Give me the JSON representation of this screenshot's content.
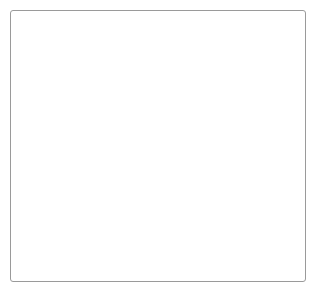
{
  "figure": {
    "title": "Lumbar spine sagittal section illustration",
    "view": "lateral sagittal",
    "style": "grayscale pen-and-ink medical illustration",
    "frame": {
      "border_color": "#9a9a9a",
      "border_width_px": 1,
      "corner_radius_px": 3,
      "background_color": "#ffffff",
      "x": 10,
      "y": 10,
      "width": 296,
      "height": 272
    }
  },
  "palette": {
    "background": "#ffffff",
    "frame_stroke": "#9a9a9a",
    "bone_light": "#f2f2f2",
    "bone_mid": "#d9d9d9",
    "bone_shadow": "#a8a8a8",
    "bone_outline": "#4d4d4d",
    "disc_dark": "#3a3a3a",
    "disc_mid": "#5e5e5e",
    "disc_highlight": "#8d8d8d",
    "ligament_fiber": "#2e2e2e",
    "cartilage_white": "#ffffff"
  },
  "anatomy": {
    "vertebral_bodies": [
      {
        "id": "vertebra-upper",
        "label": "Upper vertebral body",
        "level": "L3"
      },
      {
        "id": "vertebra-middle",
        "label": "Middle vertebral body",
        "level": "L4"
      },
      {
        "id": "vertebra-lower",
        "label": "Lower vertebral body",
        "level": "L5"
      }
    ],
    "discs": [
      {
        "id": "disc-upper",
        "label": "Upper intervertebral disc",
        "state": "normal"
      },
      {
        "id": "disc-herniated",
        "label": "Herniated intervertebral disc",
        "state": "posterior protrusion"
      },
      {
        "id": "disc-lower",
        "label": "Lower intervertebral disc",
        "state": "normal"
      },
      {
        "id": "disc-bottom",
        "label": "Inferior intervertebral disc margin",
        "state": "normal"
      }
    ],
    "posterior_elements": [
      {
        "id": "spinous-process-upper",
        "label": "Upper spinous process"
      },
      {
        "id": "spinous-process-middle",
        "label": "Middle spinous process"
      },
      {
        "id": "spinous-process-lower",
        "label": "Lower spinous process"
      },
      {
        "id": "facet-joint-upper",
        "label": "Upper facet joint"
      },
      {
        "id": "facet-joint-lower",
        "label": "Lower facet joint"
      },
      {
        "id": "pedicle-upper",
        "label": "Upper pedicle"
      },
      {
        "id": "pedicle-lower",
        "label": "Lower pedicle"
      }
    ],
    "ligaments": [
      {
        "id": "ligament-interspinous-upper",
        "label": "Interspinous ligament fibers, upper level",
        "pattern": "dense vertical hatching",
        "fiber_count": 22
      },
      {
        "id": "ligament-supraspinous-upper",
        "label": "Supraspinous ligament fibers, upper level",
        "pattern": "fine oblique hatching",
        "fiber_count": 14
      },
      {
        "id": "ligament-interspinous-middle",
        "label": "Interspinous ligament fibers, middle level",
        "pattern": "splayed irregular fibers",
        "fiber_count": 16
      },
      {
        "id": "ligament-interspinous-lower",
        "label": "Interspinous ligament fibers, lower level",
        "pattern": "dense vertical hatching",
        "fiber_count": 24
      },
      {
        "id": "ligament-capsular-lower",
        "label": "Facet capsular ligament fibers",
        "pattern": "short oblique hatching",
        "fiber_count": 18
      },
      {
        "id": "ligament-anterior-longitudinal",
        "label": "Anterior longitudinal ligament",
        "pattern": "continuous outline"
      }
    ]
  }
}
